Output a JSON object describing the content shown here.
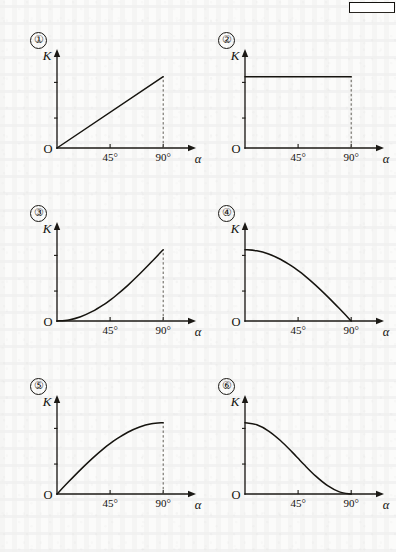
{
  "page": {
    "kind": "scanned-textbook-figure-page",
    "background_color": "#fbfbfa",
    "ink_color": "#16140f",
    "artifact_label": ""
  },
  "axes_labels": {
    "y_axis": "K",
    "x_axis": "α",
    "origin": "O",
    "tick_45": "45°",
    "tick_90": "90°"
  },
  "chart_data": [
    {
      "type": "line",
      "title": "①",
      "index_label": "①",
      "xlabel": "α",
      "ylabel": "K",
      "xlim": [
        0,
        100
      ],
      "ylim": [
        0,
        1.15
      ],
      "xticks": [
        45,
        90
      ],
      "xticklabels": [
        "45°",
        "90°"
      ],
      "grid": false,
      "legend": "none",
      "shape": "linear-increasing",
      "description": "K rises linearly from 0 at α=0 to maximum at α=90°",
      "dashed_dropline_at_x": 90,
      "x": [
        0,
        10,
        20,
        30,
        40,
        45,
        50,
        60,
        70,
        80,
        90
      ],
      "y": [
        0.0,
        0.11,
        0.22,
        0.33,
        0.44,
        0.5,
        0.56,
        0.67,
        0.78,
        0.89,
        1.0
      ]
    },
    {
      "type": "line",
      "title": "②",
      "index_label": "②",
      "xlabel": "α",
      "ylabel": "K",
      "xlim": [
        0,
        100
      ],
      "ylim": [
        0,
        1.15
      ],
      "xticks": [
        45,
        90
      ],
      "xticklabels": [
        "45°",
        "90°"
      ],
      "grid": false,
      "legend": "none",
      "shape": "constant",
      "description": "K stays constant at its maximum value for all α from 0 to 90°",
      "dashed_dropline_at_x": 90,
      "x": [
        0,
        10,
        20,
        30,
        40,
        45,
        50,
        60,
        70,
        80,
        90
      ],
      "y": [
        1.0,
        1.0,
        1.0,
        1.0,
        1.0,
        1.0,
        1.0,
        1.0,
        1.0,
        1.0,
        1.0
      ]
    },
    {
      "type": "line",
      "title": "③",
      "index_label": "③",
      "xlabel": "α",
      "ylabel": "K",
      "xlim": [
        0,
        100
      ],
      "ylim": [
        0,
        1.15
      ],
      "xticks": [
        45,
        90
      ],
      "xticklabels": [
        "45°",
        "90°"
      ],
      "grid": false,
      "legend": "none",
      "shape": "convex-increasing",
      "description": "K increases from 0 with upward curvature, reaching maximum at α=90° (1−cosα form)",
      "dashed_dropline_at_x": 90,
      "x": [
        0,
        10,
        20,
        30,
        40,
        45,
        50,
        60,
        70,
        80,
        90
      ],
      "y": [
        0.0,
        0.015,
        0.06,
        0.134,
        0.234,
        0.293,
        0.357,
        0.5,
        0.658,
        0.826,
        1.0
      ]
    },
    {
      "type": "line",
      "title": "④",
      "index_label": "④",
      "xlabel": "α",
      "ylabel": "K",
      "xlim": [
        0,
        100
      ],
      "ylim": [
        0,
        1.15
      ],
      "xticks": [
        45,
        90
      ],
      "xticklabels": [
        "45°",
        "90°"
      ],
      "grid": false,
      "legend": "none",
      "shape": "concave-decreasing-to-zero",
      "description": "K falls from its maximum at α=0 to 0 at α=90°, flattening near 90° (cosα form)",
      "dashed_dropline_at_x": null,
      "x": [
        0,
        10,
        20,
        30,
        40,
        45,
        50,
        60,
        70,
        80,
        90
      ],
      "y": [
        1.0,
        0.985,
        0.94,
        0.866,
        0.766,
        0.707,
        0.643,
        0.5,
        0.342,
        0.174,
        0.0
      ]
    },
    {
      "type": "line",
      "title": "⑤",
      "index_label": "⑤",
      "xlabel": "α",
      "ylabel": "K",
      "xlim": [
        0,
        100
      ],
      "ylim": [
        0,
        1.15
      ],
      "xticks": [
        45,
        90
      ],
      "xticklabels": [
        "45°",
        "90°"
      ],
      "grid": false,
      "legend": "none",
      "shape": "concave-increasing",
      "description": "K rises from 0 with downward curvature, levelling off to maximum at α=90° (sinα form)",
      "dashed_dropline_at_x": 90,
      "x": [
        0,
        10,
        20,
        30,
        40,
        45,
        50,
        60,
        70,
        80,
        90
      ],
      "y": [
        0.0,
        0.174,
        0.342,
        0.5,
        0.643,
        0.707,
        0.766,
        0.866,
        0.94,
        0.985,
        1.0
      ]
    },
    {
      "type": "line",
      "title": "⑥",
      "index_label": "⑥",
      "xlabel": "α",
      "ylabel": "K",
      "xlim": [
        0,
        100
      ],
      "ylim": [
        0,
        1.15
      ],
      "xticks": [
        45,
        90
      ],
      "xticklabels": [
        "45°",
        "90°"
      ],
      "grid": false,
      "legend": "none",
      "shape": "convex-decreasing-to-zero",
      "description": "K falls from its maximum at α=0 to 0 at α=90°, steepening near 90° (1−sinα / cos² form)",
      "dashed_dropline_at_x": null,
      "x": [
        0,
        10,
        20,
        30,
        40,
        45,
        50,
        60,
        70,
        80,
        90
      ],
      "y": [
        1.0,
        0.97,
        0.883,
        0.75,
        0.587,
        0.5,
        0.413,
        0.25,
        0.117,
        0.03,
        0.0
      ]
    }
  ]
}
